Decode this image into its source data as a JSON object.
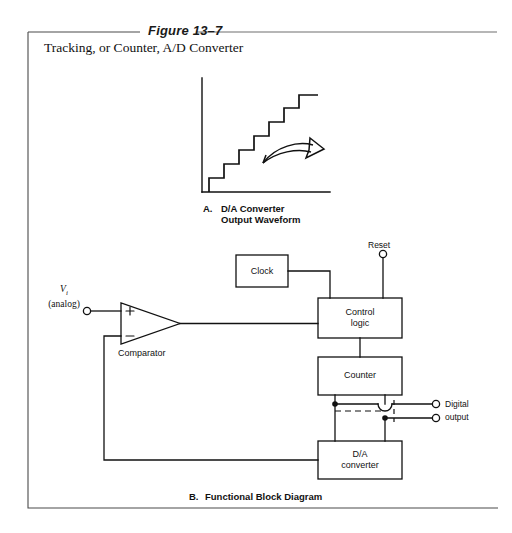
{
  "figure": {
    "number_label": "Figure 13–7",
    "title": "Tracking, or Counter, A/D Converter"
  },
  "panel_a": {
    "caption_prefix": "A.",
    "caption_line1": "D/A Converter",
    "caption_line2": "Output Waveform",
    "waveform": {
      "type": "staircase",
      "steps": 7,
      "direction": "rising",
      "arrow": "curved-right-arrow"
    }
  },
  "panel_b": {
    "caption_prefix": "B.",
    "caption_line1": "Functional Block Diagram",
    "input": {
      "symbol": "V",
      "subscript": "i",
      "qualifier": "(analog)"
    },
    "comparator": {
      "label": "Comparator",
      "plus_sign": "+",
      "minus_sign": "−"
    },
    "blocks": [
      {
        "id": "clock",
        "line1": "Clock",
        "line2": ""
      },
      {
        "id": "control-logic",
        "line1": "Control",
        "line2": "logic"
      },
      {
        "id": "counter",
        "line1": "Counter",
        "line2": ""
      },
      {
        "id": "da-converter",
        "line1": "D/A",
        "line2": "converter"
      }
    ],
    "reset": {
      "label": "Reset"
    },
    "output": {
      "line1": "Digital",
      "line2": "output"
    }
  },
  "colors": {
    "ink": "#111111",
    "rule": "#6e6e6e",
    "frame": "#4a4a4a",
    "paper": "#ffffff"
  }
}
